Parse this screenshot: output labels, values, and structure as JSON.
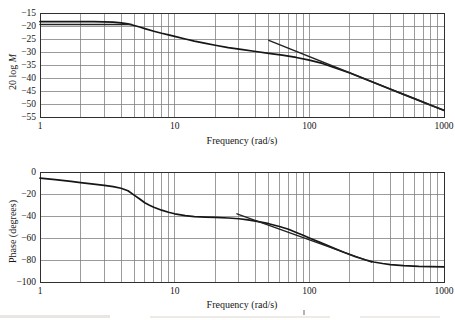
{
  "chart_data": [
    {
      "type": "line",
      "title": "",
      "xlabel": "Frequency (rad/s)",
      "ylabel": "20 log M",
      "ylabel_prefix": "20 log ",
      "ylabel_var": "M",
      "x_scale": "log",
      "x_range": [
        1,
        1000
      ],
      "x_ticks": [
        1,
        10,
        100,
        1000
      ],
      "y_range": [
        -55,
        -15
      ],
      "y_ticks": [
        -15,
        -20,
        -25,
        -30,
        -35,
        -40,
        -45,
        -50,
        -55
      ],
      "grid": true,
      "legend": "none",
      "series": [
        {
          "name": "magnitude-response",
          "points": [
            [
              1,
              -18.3
            ],
            [
              1.5,
              -18.3
            ],
            [
              2,
              -18.3
            ],
            [
              2.5,
              -18.35
            ],
            [
              3,
              -18.4
            ],
            [
              3.5,
              -18.5
            ],
            [
              4,
              -18.8
            ],
            [
              4.5,
              -19.2
            ],
            [
              5,
              -19.8
            ],
            [
              5.5,
              -20.4
            ],
            [
              6,
              -21.0
            ],
            [
              7,
              -22.0
            ],
            [
              8,
              -22.8
            ],
            [
              9,
              -23.4
            ],
            [
              10,
              -24.0
            ],
            [
              12,
              -25.0
            ],
            [
              14,
              -25.8
            ],
            [
              17,
              -26.7
            ],
            [
              20,
              -27.4
            ],
            [
              25,
              -28.3
            ],
            [
              32,
              -29.1
            ],
            [
              40,
              -29.8
            ],
            [
              50,
              -30.5
            ],
            [
              63,
              -31.2
            ],
            [
              80,
              -32.1
            ],
            [
              100,
              -33.1
            ],
            [
              125,
              -34.4
            ],
            [
              160,
              -36.3
            ],
            [
              200,
              -38.1
            ],
            [
              250,
              -40.1
            ],
            [
              320,
              -42.3
            ],
            [
              400,
              -44.3
            ],
            [
              500,
              -46.3
            ],
            [
              650,
              -48.6
            ],
            [
              800,
              -50.5
            ],
            [
              1000,
              -52.4
            ]
          ]
        },
        {
          "name": "low-frequency-asymptote",
          "points": [
            [
              1,
              -19.4
            ],
            [
              4.8,
              -19.4
            ]
          ]
        },
        {
          "name": "high-frequency-asymptote",
          "points": [
            [
              50,
              -25.5
            ],
            [
              1000,
              -52.5
            ]
          ]
        }
      ]
    },
    {
      "type": "line",
      "title": "",
      "xlabel": "Frequency (rad/s)",
      "ylabel": "Phase (degrees)",
      "ylabel_prefix": "Phase (degrees)",
      "ylabel_var": "",
      "x_scale": "log",
      "x_range": [
        1,
        1000
      ],
      "x_ticks": [
        1,
        10,
        100,
        1000
      ],
      "y_range": [
        -100,
        0
      ],
      "y_ticks": [
        0,
        -20,
        -40,
        -60,
        -80,
        -100
      ],
      "grid": true,
      "legend": "none",
      "series": [
        {
          "name": "phase-response",
          "points": [
            [
              1,
              -5.5
            ],
            [
              1.3,
              -7
            ],
            [
              1.7,
              -8.6
            ],
            [
              2,
              -9.7
            ],
            [
              2.5,
              -11
            ],
            [
              3,
              -12.2
            ],
            [
              3.5,
              -13.3
            ],
            [
              4,
              -14.8
            ],
            [
              4.5,
              -17
            ],
            [
              5,
              -21
            ],
            [
              5.5,
              -24.5
            ],
            [
              6,
              -28
            ],
            [
              6.5,
              -30.2
            ],
            [
              7,
              -32
            ],
            [
              8,
              -34.7
            ],
            [
              9,
              -36.6
            ],
            [
              10,
              -38
            ],
            [
              12,
              -39.7
            ],
            [
              14,
              -40.5
            ],
            [
              17,
              -41
            ],
            [
              20,
              -41.3
            ],
            [
              25,
              -41.8
            ],
            [
              30,
              -42.5
            ],
            [
              35,
              -43.5
            ],
            [
              40,
              -44.7
            ],
            [
              50,
              -47
            ],
            [
              60,
              -49.5
            ],
            [
              70,
              -52
            ],
            [
              80,
              -55
            ],
            [
              90,
              -57.5
            ],
            [
              100,
              -60
            ],
            [
              120,
              -64
            ],
            [
              150,
              -69
            ],
            [
              180,
              -73
            ],
            [
              220,
              -77
            ],
            [
              260,
              -79.8
            ],
            [
              300,
              -81.8
            ],
            [
              350,
              -83.2
            ],
            [
              400,
              -84.2
            ],
            [
              500,
              -85.2
            ],
            [
              650,
              -85.8
            ],
            [
              800,
              -86
            ],
            [
              1000,
              -86.2
            ]
          ]
        },
        {
          "name": "phase-asymptote",
          "points": [
            [
              29,
              -38
            ],
            [
              290,
              -82
            ]
          ]
        }
      ]
    }
  ],
  "style": {
    "grid_color": "#7a7a7a",
    "frame_color": "#2f2f2f",
    "curve_color": "#161616",
    "asymptote_color": "#222222"
  }
}
